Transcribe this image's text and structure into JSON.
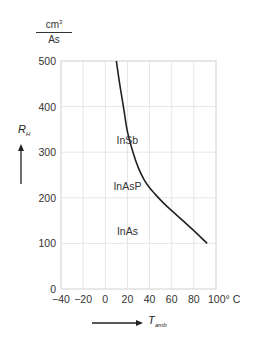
{
  "chart_data": {
    "type": "line",
    "title": "",
    "unit_label": {
      "numerator": "cm³",
      "denominator": "As"
    },
    "xlabel": "T",
    "xlabel_sub": "amb",
    "ylabel": "R",
    "ylabel_sub": "H",
    "x_unit": "° C",
    "xlim": [
      -40,
      100
    ],
    "ylim": [
      0,
      500
    ],
    "x_ticks": [
      -40,
      -20,
      0,
      20,
      40,
      60,
      80,
      100
    ],
    "x_tick_labels": [
      "−40",
      "−20",
      "0",
      "20",
      "40",
      "60",
      "80",
      "100° C"
    ],
    "y_ticks": [
      0,
      100,
      200,
      300,
      400,
      500
    ],
    "y_tick_labels": [
      "0",
      "100",
      "200",
      "300",
      "400",
      "500"
    ],
    "grid": true,
    "series": [
      {
        "name": "R_H vs T_amb",
        "x": [
          10,
          13,
          17,
          20,
          25,
          30,
          35,
          40,
          45,
          50,
          55,
          60,
          70,
          80,
          92
        ],
        "y": [
          500,
          450,
          390,
          345,
          300,
          265,
          240,
          222,
          208,
          195,
          183,
          172,
          150,
          128,
          100
        ]
      }
    ],
    "annotations": [
      {
        "text": "InSb",
        "x": 20,
        "y": 300
      },
      {
        "text": "InAsP",
        "x": 20,
        "y": 200
      },
      {
        "text": "InAs",
        "x": 20,
        "y": 100
      }
    ]
  },
  "colors": {
    "curve": "#222222",
    "grid": "#e6e6e6",
    "text": "#333333"
  }
}
